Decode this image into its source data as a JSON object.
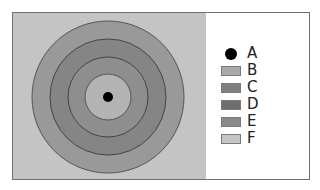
{
  "diagram": {
    "type": "concentric-target",
    "center": {
      "x": 108,
      "y": 97
    },
    "background": {
      "label": "F",
      "color": "#c4c4c4"
    },
    "rings": [
      {
        "label": "E",
        "radius": 76,
        "color": "#999999"
      },
      {
        "label": "D",
        "radius": 58,
        "color": "#858585"
      },
      {
        "label": "C",
        "radius": 40,
        "color": "#8e8e8e"
      },
      {
        "label": "B",
        "radius": 23,
        "color": "#b3b3b3"
      }
    ],
    "center_dot": {
      "label": "A",
      "radius": 5,
      "color": "#000000"
    }
  },
  "legend": {
    "items": [
      {
        "label": "A",
        "kind": "dot",
        "color": "#000000"
      },
      {
        "label": "B",
        "kind": "swatch",
        "color": "#a9a9a9"
      },
      {
        "label": "C",
        "kind": "swatch",
        "color": "#7f7f7f"
      },
      {
        "label": "D",
        "kind": "swatch",
        "color": "#6e6e6e"
      },
      {
        "label": "E",
        "kind": "swatch",
        "color": "#8a8a8a"
      },
      {
        "label": "F",
        "kind": "swatch",
        "color": "#c4c4c4"
      }
    ]
  }
}
